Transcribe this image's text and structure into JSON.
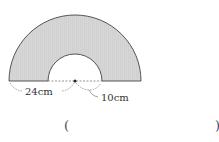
{
  "figure": {
    "shape": "semicircular-ring",
    "fill_color": "#d4d4d4",
    "outer_label": "24cm",
    "inner_label": "10cm"
  },
  "answer": {
    "open_paren": "(",
    "close_paren": ")"
  }
}
